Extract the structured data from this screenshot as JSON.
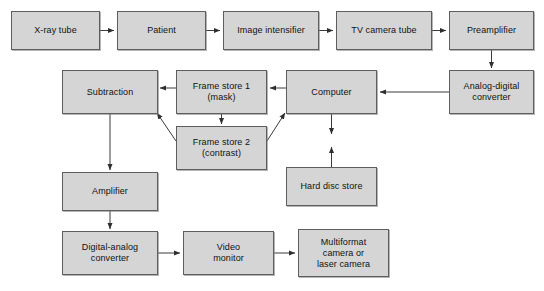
{
  "diagram": {
    "type": "flowchart",
    "colors": {
      "node_fill": "#d5d5d5",
      "node_border": "#5e5e5e",
      "line": "#3a3a3a",
      "background": "#ffffff",
      "text": "#111111"
    },
    "nodes": [
      {
        "id": "xray_tube",
        "label": "X-ray tube",
        "x": 11,
        "y": 11,
        "w": 89,
        "h": 39
      },
      {
        "id": "patient",
        "label": "Patient",
        "x": 117,
        "y": 11,
        "w": 89,
        "h": 39
      },
      {
        "id": "image_intensifier",
        "label": "Image intensifier",
        "x": 223,
        "y": 11,
        "w": 96,
        "h": 39
      },
      {
        "id": "tv_camera_tube",
        "label": "TV camera tube",
        "x": 336,
        "y": 11,
        "w": 96,
        "h": 39
      },
      {
        "id": "preamplifier",
        "label": "Preamplifier",
        "x": 449,
        "y": 11,
        "w": 85,
        "h": 39
      },
      {
        "id": "subtraction",
        "label": "Subtraction",
        "x": 62,
        "y": 70,
        "w": 96,
        "h": 44
      },
      {
        "id": "frame_store_1",
        "label": "Frame store 1\n(mask)",
        "x": 176,
        "y": 70,
        "w": 91,
        "h": 44
      },
      {
        "id": "computer",
        "label": "Computer",
        "x": 286,
        "y": 70,
        "w": 91,
        "h": 44
      },
      {
        "id": "adc",
        "label": "Analog-digital\nconverter",
        "x": 449,
        "y": 70,
        "w": 85,
        "h": 44
      },
      {
        "id": "frame_store_2",
        "label": "Frame store 2\n(contrast)",
        "x": 176,
        "y": 126,
        "w": 91,
        "h": 44
      },
      {
        "id": "amplifier",
        "label": "Amplifier",
        "x": 62,
        "y": 172,
        "w": 96,
        "h": 39
      },
      {
        "id": "hard_disc_store",
        "label": "Hard disc store",
        "x": 286,
        "y": 167,
        "w": 91,
        "h": 39
      },
      {
        "id": "dac",
        "label": "Digital-analog\nconverter",
        "x": 62,
        "y": 231,
        "w": 96,
        "h": 44
      },
      {
        "id": "video_monitor",
        "label": "Video\nmonitor",
        "x": 183,
        "y": 231,
        "w": 91,
        "h": 44
      },
      {
        "id": "multiformat",
        "label": "Multiformat\ncamera or\nlaser camera",
        "x": 298,
        "y": 229,
        "w": 91,
        "h": 48
      }
    ],
    "connections": [
      {
        "from": "xray_tube",
        "to": "patient",
        "kind": "arrow"
      },
      {
        "from": "patient",
        "to": "image_intensifier",
        "kind": "arrow"
      },
      {
        "from": "image_intensifier",
        "to": "tv_camera_tube",
        "kind": "arrow"
      },
      {
        "from": "tv_camera_tube",
        "to": "preamplifier",
        "kind": "arrow"
      },
      {
        "from": "preamplifier",
        "to": "adc",
        "kind": "arrow"
      },
      {
        "from": "adc",
        "to": "computer",
        "kind": "arrow"
      },
      {
        "from": "computer",
        "to": "frame_store_1",
        "kind": "arrow"
      },
      {
        "from": "frame_store_1",
        "to": "subtraction",
        "kind": "arrow"
      },
      {
        "from": "frame_store_1",
        "to": "frame_store_2",
        "kind": "arrow"
      },
      {
        "from": "frame_store_2",
        "to": "subtraction",
        "kind": "arrow-diagonal"
      },
      {
        "from": "frame_store_2",
        "to": "computer",
        "kind": "arrow-diagonal"
      },
      {
        "from": "computer",
        "to": "hard_disc_store",
        "kind": "arrow-bidirectional"
      },
      {
        "from": "subtraction",
        "to": "amplifier",
        "kind": "arrow"
      },
      {
        "from": "amplifier",
        "to": "dac",
        "kind": "arrow"
      },
      {
        "from": "dac",
        "to": "video_monitor",
        "kind": "arrow"
      },
      {
        "from": "video_monitor",
        "to": "multiformat",
        "kind": "arrow"
      }
    ]
  }
}
